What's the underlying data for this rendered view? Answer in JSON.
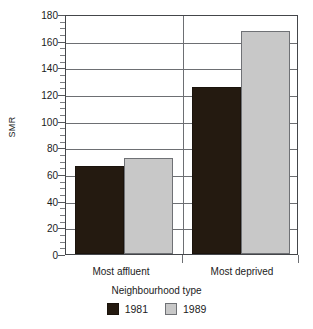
{
  "chart_data": {
    "type": "bar",
    "title": "",
    "xlabel": "Neighbourhood type",
    "ylabel": "SMR",
    "categories": [
      "Most affluent",
      "Most deprived"
    ],
    "series": [
      {
        "name": "1981",
        "color": "#241a10",
        "values": [
          66,
          125
        ]
      },
      {
        "name": "1989",
        "color": "#c8c8c8",
        "values": [
          72,
          167
        ]
      }
    ],
    "ylim": [
      0,
      180
    ],
    "y_major_ticks": [
      0,
      20,
      40,
      60,
      80,
      100,
      120,
      140,
      160,
      180
    ],
    "y_tick_labels": [
      "0",
      "20",
      "40",
      "60",
      "80",
      "100",
      "120",
      "140",
      "160",
      "180"
    ],
    "y_minor_tick_interval": 5,
    "grid": "horizontal",
    "legend_position": "bottom",
    "group_divider": true
  },
  "legend": {
    "items": [
      {
        "label": "1981",
        "swatch": "legend-swatch-1981"
      },
      {
        "label": "1989",
        "swatch": "legend-swatch-1989"
      }
    ]
  },
  "colors": {
    "series_1981": "#241a10",
    "series_1989": "#c8c8c8",
    "frame": "#44464a",
    "gridline": "#6d6f73",
    "text": "#1b1b1b",
    "background": "#ffffff"
  }
}
